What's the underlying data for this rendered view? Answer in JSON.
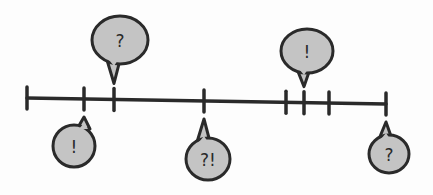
{
  "diagram": {
    "type": "timeline",
    "colors": {
      "stroke": "#2a2a2a",
      "bubble_fill": "#c4c4c4",
      "background": "#fdfdfd"
    },
    "line": {
      "x1": 27,
      "y1": 98,
      "x2": 386,
      "y2": 104
    },
    "ticks": [
      27,
      84,
      114,
      204,
      286,
      304,
      329,
      386
    ],
    "bubbles": [
      {
        "label": "?",
        "position": "above",
        "tick_x": 114,
        "cx": 120,
        "cy": 40,
        "rx": 28,
        "ry": 24
      },
      {
        "label": "!",
        "position": "below",
        "tick_x": 84,
        "cx": 74,
        "cy": 146,
        "rx": 21,
        "ry": 21
      },
      {
        "label": "?!",
        "position": "below",
        "tick_x": 204,
        "cx": 208,
        "cy": 159,
        "rx": 22,
        "ry": 21
      },
      {
        "label": "!",
        "position": "above",
        "tick_x": 304,
        "cx": 307,
        "cy": 51,
        "rx": 26,
        "ry": 22
      },
      {
        "label": "?",
        "position": "below",
        "tick_x": 386,
        "cx": 389,
        "cy": 154,
        "rx": 20,
        "ry": 19
      }
    ]
  }
}
